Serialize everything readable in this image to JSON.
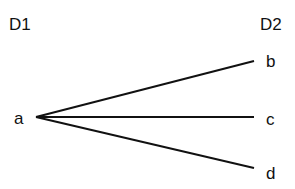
{
  "diagram": {
    "headers": {
      "left": "D1",
      "right": "D2"
    },
    "source": {
      "label": "a"
    },
    "targets": [
      {
        "label": "b"
      },
      {
        "label": "c"
      },
      {
        "label": "d"
      }
    ],
    "edges": [
      {
        "from": "a",
        "to": "b"
      },
      {
        "from": "a",
        "to": "c"
      },
      {
        "from": "a",
        "to": "d"
      }
    ],
    "line_color": "#111111"
  }
}
